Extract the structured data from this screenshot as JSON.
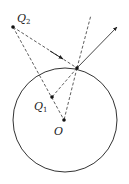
{
  "diagram": {
    "colors": {
      "stroke": "#333333",
      "background": "#ffffff"
    },
    "circle": {
      "center_label": "O",
      "cx": 65,
      "cy": 120,
      "r": 52
    },
    "points": [
      {
        "id": "Q2",
        "label": "Q",
        "subscript": "2",
        "x": 13,
        "y": 27
      },
      {
        "id": "Q1",
        "label": "Q",
        "subscript": "1",
        "x": 52,
        "y": 97
      },
      {
        "id": "O",
        "label": "O",
        "subscript": "",
        "x": 64,
        "y": 120
      },
      {
        "id": "P",
        "label": "",
        "subscript": "",
        "x": 77,
        "y": 68
      }
    ],
    "lines": [
      {
        "from": "Q2",
        "to": "P",
        "style": "dashed",
        "arrow": "mid"
      },
      {
        "from": "P",
        "to": "outgoing",
        "style": "solid",
        "arrow": "end"
      },
      {
        "from": "P",
        "to": "normal-ext",
        "style": "dashed"
      },
      {
        "from": "Q2",
        "to": "O-dir",
        "style": "dashed"
      },
      {
        "from": "P",
        "to": "Q1",
        "style": "dashed"
      },
      {
        "from": "Q1",
        "to": "O",
        "style": "dashed"
      },
      {
        "from": "P",
        "to": "O",
        "style": "dashed"
      }
    ]
  }
}
